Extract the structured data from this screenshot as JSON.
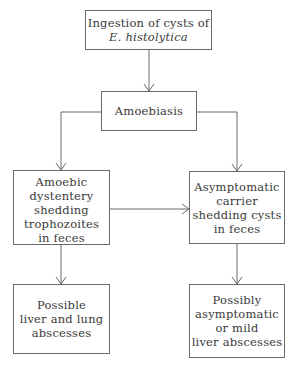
{
  "diagram": {
    "type": "flowchart",
    "nodes": [
      {
        "id": "ingestion",
        "lines": [
          "Ingestion of cysts of",
          "E. histolytica"
        ],
        "italic_line": 1
      },
      {
        "id": "amoebiasis",
        "lines": [
          "Amoebiasis"
        ]
      },
      {
        "id": "dysentery",
        "lines": [
          "Amoebic",
          "dystentery",
          "shedding",
          "trophozoites",
          "in feces"
        ]
      },
      {
        "id": "carrier",
        "lines": [
          "Asymptomatic",
          "carrier",
          "shedding cysts",
          "in feces"
        ]
      },
      {
        "id": "liver_lung",
        "lines": [
          "Possible",
          "liver and lung",
          "abscesses"
        ]
      },
      {
        "id": "mild_liver",
        "lines": [
          "Possibly",
          "asymptomatic",
          "or mild",
          "liver abscesses"
        ]
      }
    ],
    "edges": [
      {
        "from": "ingestion",
        "to": "amoebiasis"
      },
      {
        "from": "amoebiasis",
        "to": "dysentery"
      },
      {
        "from": "amoebiasis",
        "to": "carrier"
      },
      {
        "from": "dysentery",
        "to": "carrier"
      },
      {
        "from": "dysentery",
        "to": "liver_lung"
      },
      {
        "from": "carrier",
        "to": "mild_liver"
      }
    ],
    "colors": {
      "stroke": "#6a6a6a",
      "text": "#3a3a3a",
      "background": "#ffffff"
    }
  }
}
